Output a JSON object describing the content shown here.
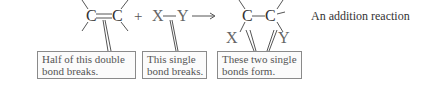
{
  "reactants": {
    "alkene": {
      "left_atom": "C",
      "right_atom": "C",
      "bond": "double"
    },
    "plus": "+",
    "reagent": {
      "left_atom": "X",
      "right_atom": "Y",
      "bond": "single"
    }
  },
  "arrow": "reaction-arrow",
  "product": {
    "left_atom": "C",
    "right_atom": "C",
    "left_substituent": "X",
    "right_substituent": "Y"
  },
  "caption": "An addition reaction",
  "callouts": [
    {
      "line1": "Half of this double",
      "line2": "bond breaks."
    },
    {
      "line1": "This single",
      "line2": "bond breaks."
    },
    {
      "line1": "These two single",
      "line2": "bonds form."
    }
  ],
  "colors": {
    "text": "#333333",
    "box_border": "#8a8a8a",
    "lines": "#555555"
  }
}
